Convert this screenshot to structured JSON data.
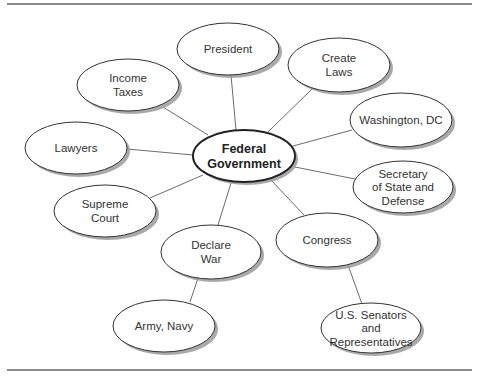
{
  "diagram": {
    "rules": [
      {
        "x1": 7,
        "y1": 4,
        "x2": 472,
        "y2": 4
      },
      {
        "x1": 7,
        "y1": 370,
        "x2": 472,
        "y2": 370
      }
    ],
    "center": {
      "id": "federal-government",
      "lines": [
        "Federal",
        "Government"
      ],
      "cx": 244,
      "cy": 156,
      "rx": 51,
      "ry": 26
    },
    "nodes": [
      {
        "id": "president",
        "lines": [
          "President"
        ],
        "cx": 228,
        "cy": 49,
        "rx": 51,
        "ry": 26
      },
      {
        "id": "create-laws",
        "lines": [
          "Create",
          "Laws"
        ],
        "cx": 339,
        "cy": 65,
        "rx": 51,
        "ry": 27
      },
      {
        "id": "income-taxes",
        "lines": [
          "Income",
          "Taxes"
        ],
        "cx": 128,
        "cy": 85,
        "rx": 51,
        "ry": 26
      },
      {
        "id": "washington-dc",
        "lines": [
          "Washington, DC"
        ],
        "cx": 401,
        "cy": 120,
        "rx": 51,
        "ry": 27
      },
      {
        "id": "lawyers",
        "lines": [
          "Lawyers"
        ],
        "cx": 76,
        "cy": 148,
        "rx": 51,
        "ry": 26
      },
      {
        "id": "secretary-of-state-and-defense",
        "lines": [
          "Secretary",
          "of State and",
          "Defense"
        ],
        "cx": 403,
        "cy": 187,
        "rx": 50,
        "ry": 26
      },
      {
        "id": "supreme-court",
        "lines": [
          "Supreme",
          "Court"
        ],
        "cx": 105,
        "cy": 211,
        "rx": 51,
        "ry": 26
      },
      {
        "id": "congress",
        "lines": [
          "Congress"
        ],
        "cx": 327,
        "cy": 240,
        "rx": 51,
        "ry": 27
      },
      {
        "id": "declare-war",
        "lines": [
          "Declare",
          "War"
        ],
        "cx": 211,
        "cy": 252,
        "rx": 50,
        "ry": 27
      },
      {
        "id": "army-navy",
        "lines": [
          "Army, Navy"
        ],
        "cx": 164,
        "cy": 326,
        "rx": 51,
        "ry": 26
      },
      {
        "id": "us-senators-and-representatives",
        "lines": [
          "U.S. Senators",
          "and",
          "Representatives"
        ],
        "cx": 371,
        "cy": 328,
        "rx": 50,
        "ry": 25
      }
    ],
    "edges": [
      {
        "from": "federal-government",
        "to": "president",
        "x1": 236,
        "y1": 130,
        "x2": 231,
        "y2": 75
      },
      {
        "from": "federal-government",
        "to": "create-laws",
        "x1": 268,
        "y1": 132,
        "x2": 312,
        "y2": 89
      },
      {
        "from": "federal-government",
        "to": "income-taxes",
        "x1": 208,
        "y1": 135,
        "x2": 163,
        "y2": 107
      },
      {
        "from": "federal-government",
        "to": "washington-dc",
        "x1": 293,
        "y1": 146,
        "x2": 352,
        "y2": 130
      },
      {
        "from": "federal-government",
        "to": "lawyers",
        "x1": 193,
        "y1": 155,
        "x2": 127,
        "y2": 149
      },
      {
        "from": "federal-government",
        "to": "secretary-of-state-and-defense",
        "x1": 295,
        "y1": 167,
        "x2": 355,
        "y2": 179
      },
      {
        "from": "federal-government",
        "to": "supreme-court",
        "x1": 203,
        "y1": 175,
        "x2": 150,
        "y2": 198
      },
      {
        "from": "federal-government",
        "to": "congress",
        "x1": 271,
        "y1": 180,
        "x2": 304,
        "y2": 215
      },
      {
        "from": "federal-government",
        "to": "declare-war",
        "x1": 231,
        "y1": 183,
        "x2": 218,
        "y2": 225
      },
      {
        "from": "declare-war",
        "to": "army-navy",
        "x1": 198,
        "y1": 278,
        "x2": 190,
        "y2": 302
      },
      {
        "from": "congress",
        "to": "us-senators-and-representatives",
        "x1": 348,
        "y1": 265,
        "x2": 362,
        "y2": 304
      }
    ],
    "colors": {
      "background": "#ffffff",
      "stroke": "#333333",
      "edge": "#5a5a5a",
      "shadow": "#9a9a9a",
      "rule": "#8a8a8a",
      "text": "#333333"
    }
  }
}
